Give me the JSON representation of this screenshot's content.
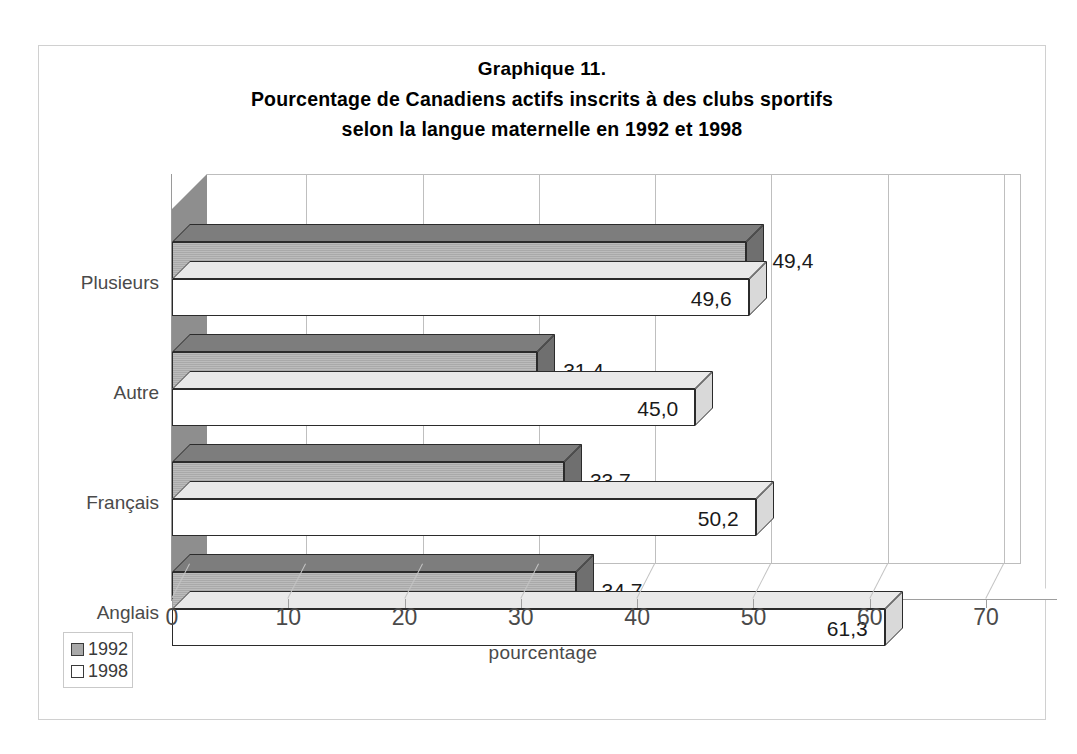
{
  "chart_data": {
    "type": "bar",
    "orientation": "horizontal",
    "title_lines": [
      "Graphique 11.",
      "Pourcentage de Canadiens actifs inscrits à des clubs sportifs",
      "selon la langue maternelle en 1992 et 1998"
    ],
    "title": "Graphique 11. Pourcentage de Canadiens actifs inscrits à des clubs sportifs selon la langue maternelle en 1992 et 1998",
    "xlabel": "pourcentage",
    "ylabel": "",
    "categories": [
      "Plusieurs",
      "Autre",
      "Français",
      "Anglais"
    ],
    "series": [
      {
        "name": "1992",
        "color": "#a9a9a9",
        "values": [
          49.4,
          31.4,
          33.7,
          34.7
        ],
        "labels": [
          "49,4",
          "31,4",
          "33,7",
          "34,7"
        ]
      },
      {
        "name": "1998",
        "color": "#ffffff",
        "values": [
          49.6,
          45.0,
          50.2,
          61.3
        ],
        "labels": [
          "49,6",
          "45,0",
          "50,2",
          "61,3"
        ]
      }
    ],
    "xlim": [
      0,
      70
    ],
    "xticks": [
      0,
      10,
      20,
      30,
      40,
      50,
      60,
      70
    ],
    "xtick_labels": [
      "0",
      "10",
      "20",
      "30",
      "40",
      "50",
      "60",
      "70"
    ],
    "grid": "vertical",
    "legend_position": "bottom-left",
    "legend_entries": [
      "1992",
      "1998"
    ],
    "decimal_separator": ",",
    "style": "3d-bar"
  }
}
